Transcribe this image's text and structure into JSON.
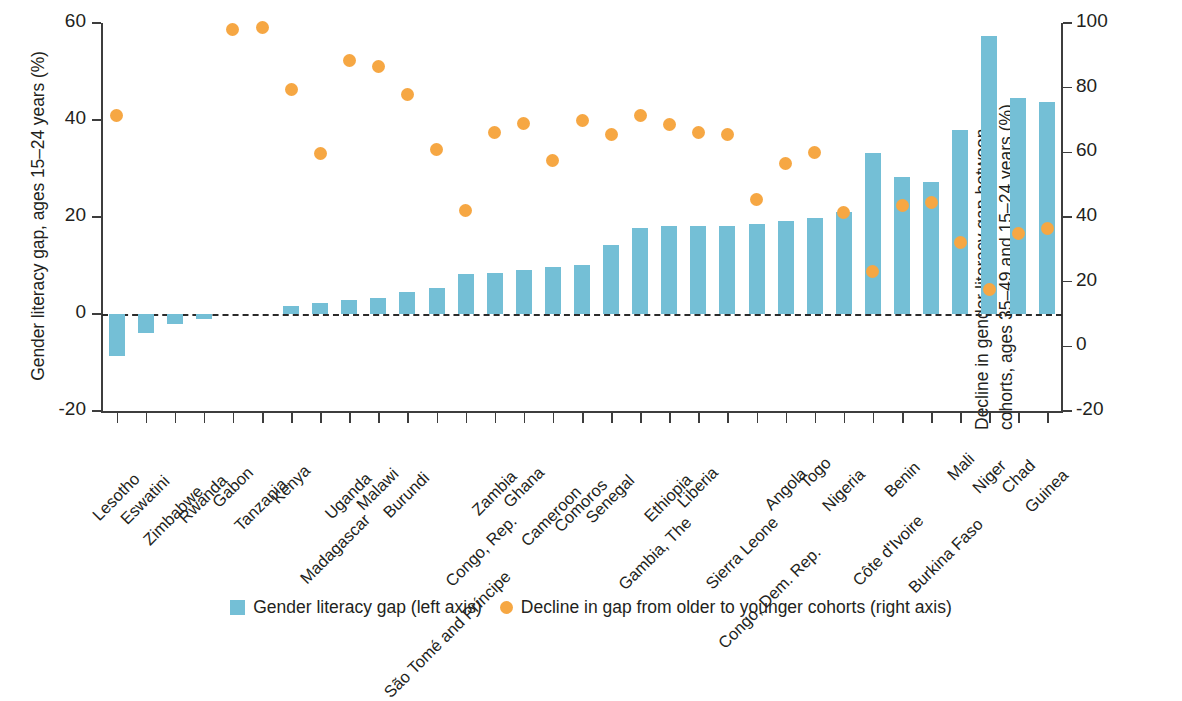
{
  "chart_data": {
    "type": "bar",
    "title": "",
    "subtitle": "",
    "ylabel": "Gender literacy gap, ages 15–24 years (%)",
    "ylabel_right": "Decline in gender literacy gap between cohorts, ages 35–49 and 15–24 years (%)",
    "ylabel_right_line1": "Decline in gender literacy gap between",
    "ylabel_right_line2": "cohorts, ages 35–49 and 15–24 years (%)",
    "xlabel": "",
    "ylim": [
      -20,
      60
    ],
    "ylim_right": [
      -20,
      100
    ],
    "yticks": [
      60,
      40,
      20,
      0,
      -20
    ],
    "yticks_right": [
      100,
      80,
      60,
      40,
      20,
      0,
      -20
    ],
    "grid": false,
    "legend_position": "bottom",
    "categories": [
      "Lesotho",
      "Eswatini",
      "Zimbabwe",
      "Rwanda",
      "Gabon",
      "Tanzania",
      "Kenya",
      "Madagascar",
      "Uganda",
      "Malawi",
      "Burundi",
      "São Tomé and Príncipe",
      "Congo, Rep.",
      "Zambia",
      "Ghana",
      "Cameroon",
      "Comoros",
      "Senegal",
      "Gambia, The",
      "Ethiopia",
      "Liberia",
      "Sierra Leone",
      "Congo, Dem. Rep.",
      "Angola",
      "Togo",
      "Nigeria",
      "Côte d'Ivoire",
      "Benin",
      "Burkina Faso",
      "Mali",
      "Niger",
      "Chad",
      "Guinea"
    ],
    "series": [
      {
        "name": "Gender literacy gap (left axis)",
        "axis": "left",
        "type": "bar",
        "color": "#74bfd6",
        "values": [
          -8.6,
          -3.9,
          -2.0,
          -1.0,
          0.0,
          0.0,
          1.7,
          2.3,
          2.8,
          3.4,
          4.6,
          5.3,
          8.2,
          8.5,
          9.0,
          9.7,
          10.1,
          14.2,
          17.8,
          18.1,
          18.1,
          18.2,
          18.6,
          19.2,
          19.8,
          21.0,
          33.2,
          28.3,
          27.2,
          38.0,
          57.3,
          44.5,
          43.8
        ]
      },
      {
        "name": "Decline in gap from older to younger cohorts (right axis)",
        "axis": "right",
        "type": "scatter",
        "color": "#f6a743",
        "values": [
          71.5,
          null,
          null,
          null,
          98.0,
          98.5,
          79.5,
          59.5,
          88.5,
          86.5,
          78.0,
          61.0,
          42.0,
          66.0,
          69.0,
          57.5,
          70.0,
          65.5,
          71.5,
          68.5,
          66.0,
          65.5,
          45.5,
          56.5,
          60.0,
          41.5,
          23.0,
          43.5,
          44.5,
          32.0,
          17.5,
          35.0,
          36.5
        ]
      }
    ],
    "legend": [
      {
        "label": "Gender literacy gap (left axis)",
        "marker": "square",
        "color": "#74bfd6"
      },
      {
        "label": "Decline in gap from older to younger cohorts (right axis)",
        "marker": "circle",
        "color": "#f6a743"
      }
    ]
  }
}
